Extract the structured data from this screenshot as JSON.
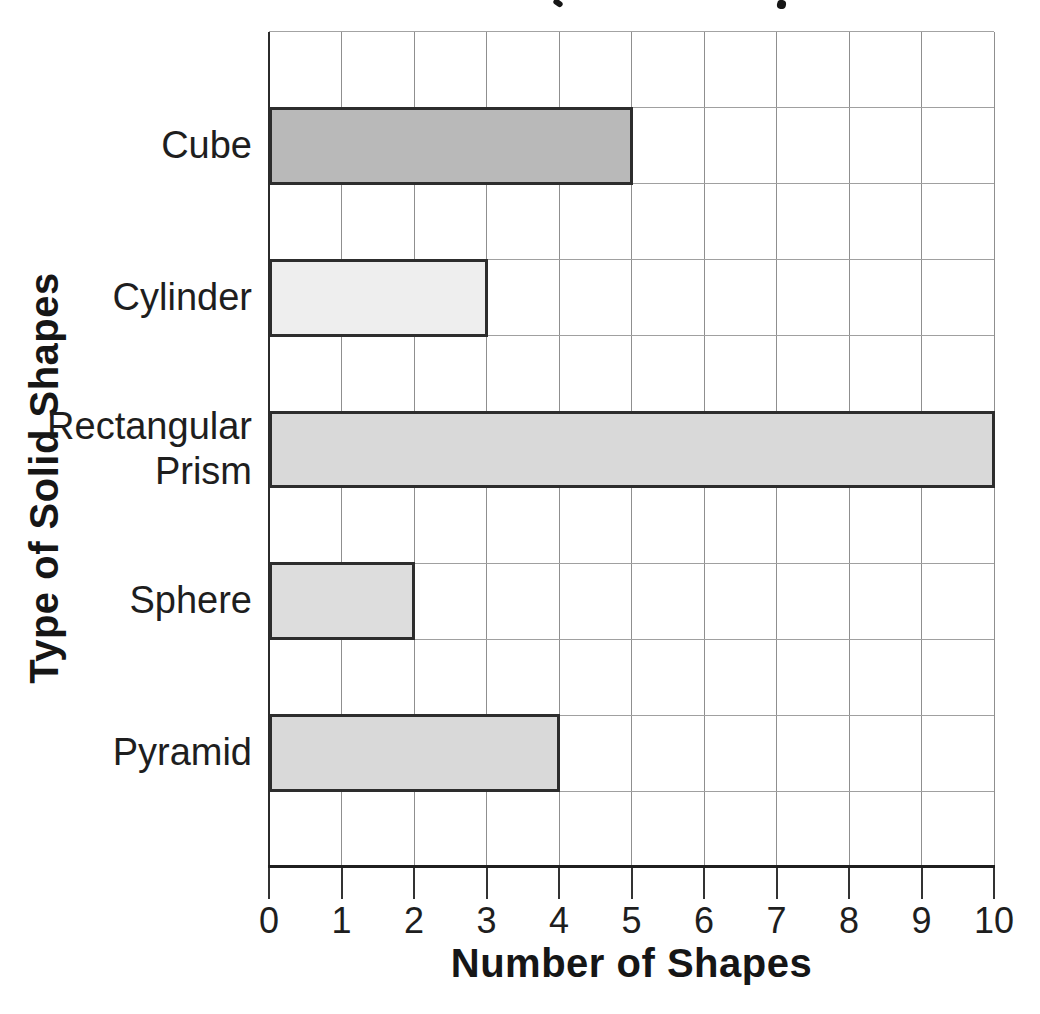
{
  "clipped_title": {
    "note": "chart title is cropped at the top edge; only two letter descender marks are visible",
    "marks": [
      {
        "x": 553,
        "y": 0,
        "w": 10,
        "h": 6,
        "rotate": 35
      },
      {
        "x": 777,
        "y": 0,
        "w": 9,
        "h": 9,
        "rotate": 8
      }
    ]
  },
  "chart_data": {
    "type": "bar",
    "orientation": "horizontal",
    "xlabel": "Number of Shapes",
    "ylabel": "Type of Solid Shapes",
    "categories": [
      "Cube",
      "Cylinder",
      "Rectangular Prism",
      "Sphere",
      "Pyramid"
    ],
    "category_label_lines": [
      [
        "Cube"
      ],
      [
        "Cylinder"
      ],
      [
        "Rectangular",
        "Prism"
      ],
      [
        "Sphere"
      ],
      [
        "Pyramid"
      ]
    ],
    "values": [
      5,
      3,
      10,
      2,
      4
    ],
    "bar_fill_colors": [
      "#b9b9b9",
      "#eeeeee",
      "#d9d9d9",
      "#dddddd",
      "#d9d9d9"
    ],
    "bar_border_color": "#2d2d2d",
    "xlim": [
      0,
      10
    ],
    "x_ticks": [
      "0",
      "1",
      "2",
      "3",
      "4",
      "5",
      "6",
      "7",
      "8",
      "9",
      "10"
    ],
    "grid": true,
    "legend": false
  }
}
